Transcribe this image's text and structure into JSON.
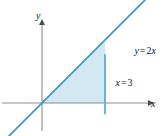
{
  "figure": {
    "number_fragment": "161.",
    "caption": ""
  },
  "axes": {
    "x_label": "x",
    "y_label": "y",
    "x_axis_color": "#8a8d92",
    "y_axis_color": "#8a8d92"
  },
  "annotations": {
    "line_label": {
      "full": "y = 2x",
      "lhs": "y",
      "operator": "=",
      "coefficient": "2",
      "variable": "x"
    },
    "vertical_line_label": {
      "full": "x = 3",
      "lhs": "x",
      "operator": "=",
      "value": "3"
    }
  },
  "colors": {
    "curve": "#3d9ec9",
    "vertical_line": "#5fb3d4",
    "region_fill": "#d4e8f4",
    "axis": "#8a8d92",
    "text": "#111111"
  },
  "chart_data": {
    "type": "line",
    "title": "",
    "subtitle": "",
    "xlabel": "x",
    "ylabel": "y",
    "xlim": [
      -1.7,
      5.6
    ],
    "ylim": [
      -1.2,
      5.0
    ],
    "grid": false,
    "legend": "none",
    "series": [
      {
        "name": "y = 2x",
        "type": "line",
        "equation": "y = 2x",
        "slope": 2,
        "intercept": 0,
        "color": "#3d9ec9",
        "x": [
          -1.7,
          5.6
        ],
        "values": [
          -3.4,
          11.2
        ]
      },
      {
        "name": "x = 3",
        "type": "line",
        "equation": "x = 3",
        "vertical": true,
        "x_value": 3,
        "color": "#5fb3d4",
        "x": [
          3,
          3
        ],
        "values": [
          -1.0,
          4.6
        ]
      }
    ],
    "shaded_region": {
      "label": "region bounded by y = 2x, x = 3, and the x-axis",
      "fill": "#d4e8f4",
      "vertices": [
        {
          "x": 0,
          "y": 0
        },
        {
          "x": 3,
          "y": 6
        },
        {
          "x": 3,
          "y": 0
        }
      ]
    },
    "annotations": [
      {
        "text": "y = 2x",
        "x": 4.4,
        "y": 5.0
      },
      {
        "text": "x = 3",
        "x": 3.5,
        "y": 1.9
      }
    ]
  }
}
